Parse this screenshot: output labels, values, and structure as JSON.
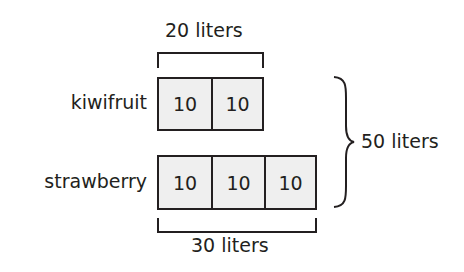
{
  "diagram": {
    "type": "tape-diagram",
    "rows": [
      {
        "label": "kiwifruit",
        "units": [
          "10",
          "10"
        ],
        "bracket_label": "20 liters",
        "bracket_position": "top"
      },
      {
        "label": "strawberry",
        "units": [
          "10",
          "10",
          "10"
        ],
        "bracket_label": "30 liters",
        "bracket_position": "bottom"
      }
    ],
    "total": {
      "label": "50 liters",
      "brace": "right"
    },
    "colors": {
      "ink": "#231f20",
      "unit_fill": "#efefef",
      "background": "#ffffff"
    }
  }
}
